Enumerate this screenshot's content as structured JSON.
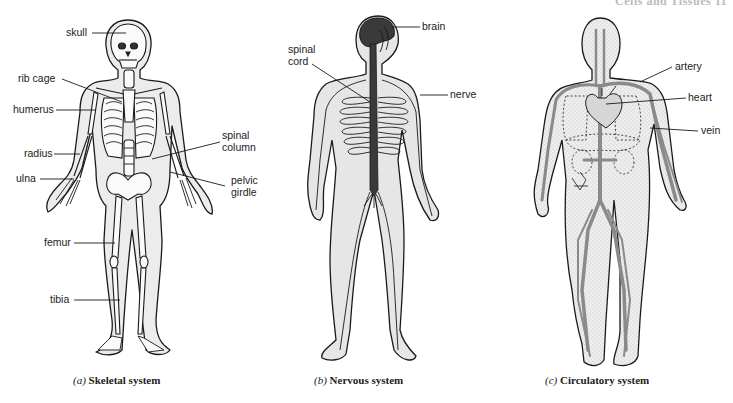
{
  "page_header": "Cells and Tissues   11",
  "figures": [
    {
      "id": "a",
      "caption_letter": "(a)",
      "caption_title": "Skeletal system",
      "labels": [
        "skull",
        "rib cage",
        "humerus",
        "radius",
        "ulna",
        "spinal column",
        "pelvic girdle",
        "femur",
        "tibia"
      ]
    },
    {
      "id": "b",
      "caption_letter": "(b)",
      "caption_title": "Nervous system",
      "labels": [
        "brain",
        "spinal cord",
        "nerve"
      ]
    },
    {
      "id": "c",
      "caption_letter": "(c)",
      "caption_title": "Circulatory system",
      "labels": [
        "artery",
        "heart",
        "vein"
      ]
    }
  ],
  "labels": {
    "skull": "skull",
    "rib_cage": "rib cage",
    "humerus": "humerus",
    "radius": "radius",
    "ulna": "ulna",
    "spinal_column_1": "spinal",
    "spinal_column_2": "column",
    "pelvic_girdle_1": "pelvic",
    "pelvic_girdle_2": "girdle",
    "femur": "femur",
    "tibia": "tibia",
    "brain": "brain",
    "spinal_cord_1": "spinal",
    "spinal_cord_2": "cord",
    "nerve": "nerve",
    "artery": "artery",
    "heart": "heart",
    "vein": "vein"
  },
  "colors": {
    "outline": "#1a1a1a",
    "body_fill": "#e6e6e6",
    "brain_fill": "#3a3a3a",
    "vessel": "#8a8a8a"
  }
}
